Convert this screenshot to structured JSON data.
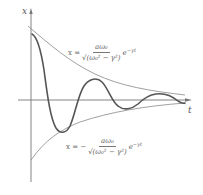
{
  "diagram": {
    "axes": {
      "vertical_label": "x",
      "horizontal_label": "t"
    },
    "upper_envelope_formula": {
      "lhs": "x =",
      "numerator": "aω₀",
      "denominator": "√(ω₀² − γ²)",
      "factor": "e",
      "exponent": "−γt"
    },
    "lower_envelope_formula": {
      "lhs": "x = −",
      "numerator": "aω₀",
      "denominator": "√(ω₀² − γ²)",
      "factor": "e",
      "exponent": "−γt"
    },
    "colors": {
      "curve": "#555555",
      "envelope": "#888888",
      "axis": "#777777",
      "background": "#ffffff"
    }
  }
}
